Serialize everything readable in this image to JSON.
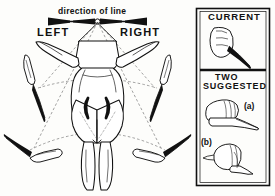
{
  "figure": {
    "title_hidden": "",
    "type": "instructional-line-diagram"
  },
  "left_diagram": {
    "direction_label": "direction of line",
    "side_left_label": "LEFT",
    "side_right_label": "RIGHT",
    "arrow": {
      "name": "double-headed-horizontal-arrow",
      "has_center_pivot": true,
      "pivot_shape": "small-open-circle"
    },
    "guide_lines": {
      "style": "dashed",
      "description": "dashed arcs and radial lines from pivot to each knife"
    },
    "knives": [
      {
        "id": "knife-upper-left",
        "position": "upper left",
        "orientation": "blade down, angled"
      },
      {
        "id": "knife-upper-right",
        "position": "upper right",
        "orientation": "blade down, angled"
      },
      {
        "id": "knife-lower-left",
        "position": "lower left",
        "orientation": "blade up-left, near horizontal"
      },
      {
        "id": "knife-lower-right",
        "position": "lower right",
        "orientation": "blade up-right, near horizontal"
      }
    ],
    "carcass": {
      "name": "carcass-rear-view",
      "features": [
        "splayed forelegs",
        "hindquarters",
        "two hind legs",
        "tail line",
        "paired crescent marks"
      ]
    }
  },
  "right_panel": {
    "panels": [
      {
        "id": "panel-current",
        "heading": "CURRENT",
        "illustration": "hand-gripping-knife-overhand",
        "sublabels": []
      },
      {
        "id": "panel-suggested",
        "heading_line1": "TWO",
        "heading_line2": "SUGGESTED",
        "illustration_a": "hand-gripping-knife-blade-forward",
        "illustration_b": "hand-gripping-knife-blade-down",
        "sublabels": [
          {
            "id": "sublabel-a",
            "text": "(a)"
          },
          {
            "id": "sublabel-b",
            "text": "(b)"
          }
        ]
      }
    ]
  },
  "colors": {
    "ink": "#111111",
    "paper": "#fdfdfb",
    "dashed": "#6b6b6b",
    "fill_dark": "#1a1a1a"
  }
}
